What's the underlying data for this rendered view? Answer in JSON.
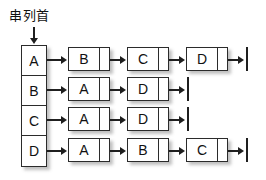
{
  "diagram": {
    "title_label": "串列首",
    "type": "adjacency-list",
    "array": {
      "name": "list-head-array",
      "cells": [
        {
          "label": "A"
        },
        {
          "label": "B"
        },
        {
          "label": "C"
        },
        {
          "label": "D"
        }
      ]
    },
    "rows": [
      {
        "head": "A",
        "nodes": [
          {
            "label": "B"
          },
          {
            "label": "C"
          },
          {
            "label": "D"
          }
        ],
        "terminator": "null"
      },
      {
        "head": "B",
        "nodes": [
          {
            "label": "A"
          },
          {
            "label": "D"
          }
        ],
        "terminator": "null"
      },
      {
        "head": "C",
        "nodes": [
          {
            "label": "A"
          },
          {
            "label": "D"
          }
        ],
        "terminator": "null"
      },
      {
        "head": "D",
        "nodes": [
          {
            "label": "A"
          },
          {
            "label": "B"
          },
          {
            "label": "C"
          }
        ],
        "terminator": "null"
      }
    ],
    "colors": {
      "stroke": "#2b2b2b",
      "fill": "#ffffff",
      "background": "#ffffff",
      "text": "#111111"
    }
  }
}
